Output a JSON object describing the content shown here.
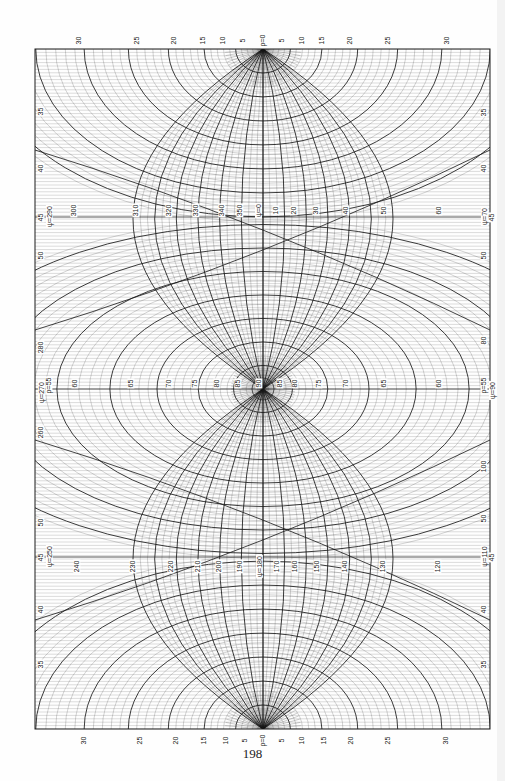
{
  "page": {
    "page_number": "198",
    "background": "#fefefe",
    "ink": "#1a1a1a"
  },
  "figure": {
    "frame": {
      "x": 35,
      "y": 49,
      "width": 455,
      "height": 680
    },
    "poles": [
      {
        "name": "top",
        "cx": 263,
        "cy": 49,
        "label": "ρ=0"
      },
      {
        "name": "center",
        "cx": 263,
        "cy": 389,
        "label": "90"
      },
      {
        "name": "bottom",
        "cx": 263,
        "cy": 729,
        "label": "ρ=0"
      }
    ],
    "top_edge_labels": [
      {
        "text": "30",
        "x": 79
      },
      {
        "text": "25",
        "x": 137
      },
      {
        "text": "20",
        "x": 174
      },
      {
        "text": "15",
        "x": 203
      },
      {
        "text": "10",
        "x": 223
      },
      {
        "text": "5",
        "x": 243
      },
      {
        "text": "ρ=0",
        "x": 263
      },
      {
        "text": "5",
        "x": 282
      },
      {
        "text": "10",
        "x": 302
      },
      {
        "text": "15",
        "x": 322
      },
      {
        "text": "20",
        "x": 350
      },
      {
        "text": "25",
        "x": 388
      },
      {
        "text": "30",
        "x": 447
      }
    ],
    "bottom_edge_labels": [
      {
        "text": "30",
        "x": 84
      },
      {
        "text": "25",
        "x": 140
      },
      {
        "text": "20",
        "x": 176
      },
      {
        "text": "15",
        "x": 204
      },
      {
        "text": "10",
        "x": 226
      },
      {
        "text": "5",
        "x": 245
      },
      {
        "text": "ρ=0",
        "x": 263
      },
      {
        "text": "5",
        "x": 282
      },
      {
        "text": "10",
        "x": 302
      },
      {
        "text": "15",
        "x": 324
      },
      {
        "text": "20",
        "x": 351
      },
      {
        "text": "25",
        "x": 388
      },
      {
        "text": "30",
        "x": 446
      }
    ],
    "left_edge_labels": [
      {
        "text": "35",
        "y": 111
      },
      {
        "text": "40",
        "y": 168
      },
      {
        "text": "45",
        "y": 217
      },
      {
        "text": "ψ=290",
        "y": 216,
        "x_offset": 8
      },
      {
        "text": "50",
        "y": 255
      },
      {
        "text": "280",
        "y": 347
      },
      {
        "text": "ψ=270",
        "y": 392
      },
      {
        "text": "ρ=55",
        "y": 385,
        "x_offset": 8
      },
      {
        "text": "260",
        "y": 432
      },
      {
        "text": "50",
        "y": 522
      },
      {
        "text": "45",
        "y": 557
      },
      {
        "text": "ψ=250",
        "y": 556,
        "x_offset": 8
      },
      {
        "text": "40",
        "y": 609
      },
      {
        "text": "35",
        "y": 664
      }
    ],
    "right_edge_labels": [
      {
        "text": "35",
        "y": 112
      },
      {
        "text": "40",
        "y": 168
      },
      {
        "text": "ψ=70",
        "y": 216
      },
      {
        "text": "45",
        "y": 217,
        "x_offset": 8
      },
      {
        "text": "50",
        "y": 255
      },
      {
        "text": "80",
        "y": 340
      },
      {
        "text": "ρ=55",
        "y": 385
      },
      {
        "text": "ψ=90",
        "y": 390,
        "x_offset": 8
      },
      {
        "text": "100",
        "y": 466
      },
      {
        "text": "50",
        "y": 518
      },
      {
        "text": "ψ=110",
        "y": 556
      },
      {
        "text": "45",
        "y": 557,
        "x_offset": 8
      },
      {
        "text": "40",
        "y": 609
      },
      {
        "text": "35",
        "y": 664
      }
    ],
    "upper_meridian_labels": [
      {
        "text": "300",
        "x": 74
      },
      {
        "text": "310",
        "x": 136
      },
      {
        "text": "320",
        "x": 169
      },
      {
        "text": "330",
        "x": 196
      },
      {
        "text": "340",
        "x": 222
      },
      {
        "text": "350",
        "x": 240
      },
      {
        "text": "ψ=0",
        "x": 258
      },
      {
        "text": "10",
        "x": 276
      },
      {
        "text": "20",
        "x": 294
      },
      {
        "text": "30",
        "x": 316
      },
      {
        "text": "40",
        "x": 346
      },
      {
        "text": "50",
        "x": 384
      },
      {
        "text": "60",
        "x": 439
      }
    ],
    "upper_meridian_label_y": 210,
    "middle_parallel_labels": [
      {
        "text": "60",
        "x": 75
      },
      {
        "text": "65",
        "x": 131
      },
      {
        "text": "70",
        "x": 169
      },
      {
        "text": "75",
        "x": 195
      },
      {
        "text": "80",
        "x": 217
      },
      {
        "text": "85",
        "x": 238
      },
      {
        "text": "90",
        "x": 259
      },
      {
        "text": "85",
        "x": 280
      },
      {
        "text": "80",
        "x": 295
      },
      {
        "text": "75",
        "x": 319
      },
      {
        "text": "70",
        "x": 346
      },
      {
        "text": "65",
        "x": 384
      },
      {
        "text": "60",
        "x": 439
      }
    ],
    "middle_parallel_label_y": 383,
    "lower_meridian_labels": [
      {
        "text": "240",
        "x": 77
      },
      {
        "text": "230",
        "x": 133
      },
      {
        "text": "220",
        "x": 171
      },
      {
        "text": "210",
        "x": 198
      },
      {
        "text": "200",
        "x": 219
      },
      {
        "text": "190",
        "x": 240
      },
      {
        "text": "ψ=180",
        "x": 259
      },
      {
        "text": "170",
        "x": 277
      },
      {
        "text": "160",
        "x": 295
      },
      {
        "text": "150",
        "x": 317
      },
      {
        "text": "140",
        "x": 345
      },
      {
        "text": "130",
        "x": 383
      },
      {
        "text": "120",
        "x": 438
      }
    ],
    "lower_meridian_label_y": 566
  }
}
